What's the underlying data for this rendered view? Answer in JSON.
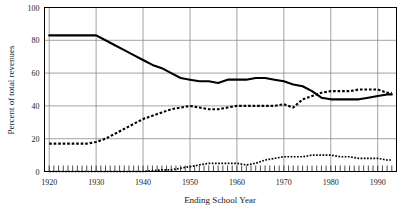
{
  "chart_data": {
    "type": "line",
    "title": "",
    "xlabel": "Ending School Year",
    "ylabel": "Percent of total revenues",
    "xlim": [
      1919,
      1994
    ],
    "ylim": [
      0,
      100
    ],
    "grid": true,
    "legend": "none",
    "xticks": [
      1920,
      1930,
      1940,
      1950,
      1960,
      1970,
      1980,
      1990
    ],
    "xtick_labels": [
      "1920",
      "1930",
      "1940",
      "1950",
      "1960",
      "1970",
      "1980",
      "1990"
    ],
    "yticks": [
      0,
      20,
      40,
      60,
      80,
      100
    ],
    "ytick_labels": [
      "0",
      "20",
      "40",
      "60",
      "80",
      "100"
    ],
    "minor_xticks_interval": 1,
    "series": [
      {
        "name": "local-share-solid",
        "style": "solid",
        "color": "#000000",
        "x": [
          1920,
          1922,
          1924,
          1926,
          1928,
          1930,
          1932,
          1934,
          1936,
          1938,
          1940,
          1942,
          1944,
          1946,
          1948,
          1950,
          1952,
          1954,
          1956,
          1958,
          1960,
          1962,
          1964,
          1966,
          1968,
          1970,
          1972,
          1974,
          1976,
          1978,
          1980,
          1982,
          1984,
          1986,
          1988,
          1990,
          1992,
          1993
        ],
        "values": [
          83,
          83,
          83,
          83,
          83,
          83,
          80,
          77,
          74,
          71,
          68,
          65,
          63,
          60,
          57,
          56,
          55,
          55,
          54,
          56,
          56,
          56,
          57,
          57,
          56,
          55,
          53,
          52,
          49,
          45,
          44,
          44,
          44,
          44,
          45,
          46,
          47,
          47
        ]
      },
      {
        "name": "state-share-dashed",
        "style": "dashed",
        "color": "#000000",
        "x": [
          1920,
          1922,
          1924,
          1926,
          1928,
          1930,
          1932,
          1934,
          1936,
          1938,
          1940,
          1942,
          1944,
          1946,
          1948,
          1950,
          1952,
          1954,
          1956,
          1958,
          1960,
          1962,
          1964,
          1966,
          1968,
          1970,
          1972,
          1974,
          1976,
          1978,
          1980,
          1982,
          1984,
          1986,
          1988,
          1990,
          1992,
          1993
        ],
        "values": [
          17,
          17,
          17,
          17,
          17,
          18,
          20,
          23,
          26,
          29,
          32,
          34,
          36,
          38,
          39,
          40,
          39,
          38,
          38,
          39,
          40,
          40,
          40,
          40,
          40,
          41,
          39,
          44,
          46,
          48,
          49,
          49,
          49,
          50,
          50,
          50,
          48,
          48
        ]
      },
      {
        "name": "federal-share-dotted",
        "style": "dotted",
        "color": "#000000",
        "x": [
          1920,
          1925,
          1930,
          1935,
          1940,
          1944,
          1946,
          1948,
          1950,
          1952,
          1954,
          1956,
          1958,
          1960,
          1962,
          1964,
          1966,
          1968,
          1970,
          1972,
          1974,
          1976,
          1978,
          1980,
          1982,
          1984,
          1986,
          1988,
          1990,
          1992,
          1993
        ],
        "values": [
          0,
          0,
          0,
          0,
          0,
          1,
          1,
          2,
          3,
          4,
          5,
          5,
          5,
          5,
          4,
          5,
          7,
          8,
          9,
          9,
          9,
          10,
          10,
          10,
          9,
          9,
          8,
          8,
          8,
          7,
          7
        ]
      }
    ]
  },
  "axes": {
    "y_title": "Percent of total revenues",
    "x_title": "Ending School Year"
  }
}
